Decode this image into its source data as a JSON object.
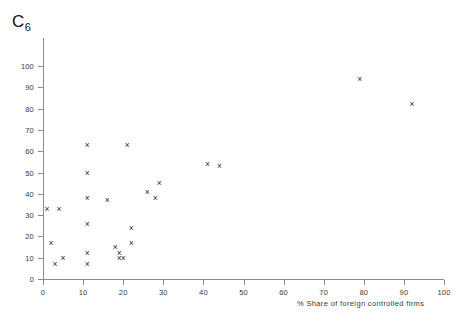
{
  "chart_data": {
    "type": "scatter",
    "title": "C6",
    "title_base": "C",
    "title_subscript": "6",
    "xlabel": "% Share of foreign controlled firms",
    "ylabel": "",
    "xlim": [
      0,
      100
    ],
    "ylim": [
      0,
      100
    ],
    "xticks": [
      0,
      10,
      20,
      30,
      40,
      50,
      60,
      70,
      80,
      90,
      100
    ],
    "yticks": [
      0,
      10,
      20,
      30,
      40,
      50,
      60,
      70,
      80,
      90,
      100
    ],
    "grid": false,
    "legend": null,
    "marker": "x",
    "marker_color": "#2b2b2b",
    "points": [
      {
        "x": 1,
        "y": 33
      },
      {
        "x": 4,
        "y": 33
      },
      {
        "x": 2,
        "y": 17
      },
      {
        "x": 3,
        "y": 7
      },
      {
        "x": 5,
        "y": 10
      },
      {
        "x": 11,
        "y": 50
      },
      {
        "x": 11,
        "y": 38
      },
      {
        "x": 11,
        "y": 26
      },
      {
        "x": 11,
        "y": 12
      },
      {
        "x": 11,
        "y": 7
      },
      {
        "x": 11,
        "y": 63
      },
      {
        "x": 16,
        "y": 37
      },
      {
        "x": 18,
        "y": 15
      },
      {
        "x": 19,
        "y": 12
      },
      {
        "x": 19,
        "y": 10
      },
      {
        "x": 20,
        "y": 10
      },
      {
        "x": 21,
        "y": 63
      },
      {
        "x": 22,
        "y": 24
      },
      {
        "x": 22,
        "y": 17
      },
      {
        "x": 26,
        "y": 41
      },
      {
        "x": 28,
        "y": 38
      },
      {
        "x": 29,
        "y": 45
      },
      {
        "x": 41,
        "y": 54
      },
      {
        "x": 44,
        "y": 53
      },
      {
        "x": 79,
        "y": 94
      },
      {
        "x": 92,
        "y": 82
      }
    ]
  }
}
